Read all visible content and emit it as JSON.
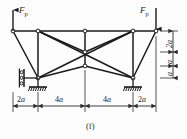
{
  "figure": {
    "caption": "(f)",
    "type": "truss-structural-diagram"
  },
  "loads": [
    {
      "id": "left-load",
      "symbol": "F",
      "subscript": "p",
      "direction": "up",
      "at_node": "A"
    },
    {
      "id": "right-load",
      "symbol": "F",
      "subscript": "p",
      "direction": "down",
      "at_node": "E"
    }
  ],
  "dimensions": {
    "horizontal": [
      {
        "id": "span-1",
        "value": "2",
        "unit": "a"
      },
      {
        "id": "span-2",
        "value": "4",
        "unit": "a"
      },
      {
        "id": "span-3",
        "value": "4",
        "unit": "a"
      },
      {
        "id": "span-4",
        "value": "2",
        "unit": "a"
      }
    ],
    "vertical": [
      {
        "id": "height-1",
        "value": "2",
        "unit": "a"
      },
      {
        "id": "height-2",
        "value": "",
        "unit": "a"
      },
      {
        "id": "height-3",
        "value": "",
        "unit": "a"
      }
    ]
  },
  "supports": [
    {
      "id": "left-horizontal-roller",
      "kind": "roller-horizontal-restraint"
    },
    {
      "id": "left-pin",
      "kind": "pin-hatched-ground"
    },
    {
      "id": "right-pin",
      "kind": "pin-hatched-ground"
    }
  ],
  "nodes": [
    {
      "id": "A",
      "x": 13,
      "y": 31
    },
    {
      "id": "B",
      "x": 38,
      "y": 31
    },
    {
      "id": "C",
      "x": 85,
      "y": 31
    },
    {
      "id": "D",
      "x": 133,
      "y": 31
    },
    {
      "id": "E",
      "x": 156,
      "y": 31
    },
    {
      "id": "F",
      "x": 85,
      "y": 52
    },
    {
      "id": "G",
      "x": 85,
      "y": 66
    },
    {
      "id": "H",
      "x": 38,
      "y": 78
    },
    {
      "id": "I",
      "x": 133,
      "y": 78
    }
  ],
  "members": [
    {
      "from": "A",
      "to": "B"
    },
    {
      "from": "B",
      "to": "C"
    },
    {
      "from": "C",
      "to": "D"
    },
    {
      "from": "D",
      "to": "E"
    },
    {
      "from": "A",
      "to": "H"
    },
    {
      "from": "B",
      "to": "H"
    },
    {
      "from": "E",
      "to": "I"
    },
    {
      "from": "D",
      "to": "I"
    },
    {
      "from": "H",
      "to": "G"
    },
    {
      "from": "I",
      "to": "G"
    },
    {
      "from": "B",
      "to": "F"
    },
    {
      "from": "C",
      "to": "F"
    },
    {
      "from": "D",
      "to": "F"
    },
    {
      "from": "F",
      "to": "G"
    },
    {
      "from": "B",
      "to": "I"
    },
    {
      "from": "D",
      "to": "H"
    }
  ],
  "colors": {
    "line": "#1b1b1b",
    "background": "#fdfdfd",
    "dimension": "#3a3a3a"
  }
}
